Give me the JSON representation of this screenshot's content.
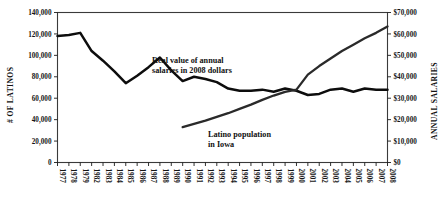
{
  "chart_data": {
    "type": "line",
    "title": "",
    "xlabel": "",
    "ylabel": "# OF LATINOS",
    "ylabel_right": "ANNUAL SALARIES",
    "grid": true,
    "legend_position": "inline-annotations",
    "ylim": [
      0,
      140000
    ],
    "ylim_right": [
      0,
      70000
    ],
    "ytick_labels": [
      "0",
      "20,000",
      "40,000",
      "60,000",
      "80,000",
      "100,000",
      "120,000",
      "140,000"
    ],
    "ytick_values": [
      0,
      20000,
      40000,
      60000,
      80000,
      100000,
      120000,
      140000
    ],
    "ytick_labels_right": [
      "$0",
      "$10,000",
      "$20,000",
      "$30,000",
      "$40,000",
      "$50,000",
      "$60,000",
      "$70,000"
    ],
    "ytick_values_right": [
      0,
      10000,
      20000,
      30000,
      40000,
      50000,
      60000,
      70000
    ],
    "categories": [
      "1977",
      "1978",
      "1979",
      "1982",
      "1983",
      "1984",
      "1985",
      "1986",
      "1987",
      "1988",
      "1989",
      "1990",
      "1991",
      "1992",
      "1993",
      "1994",
      "1995",
      "1996",
      "1997",
      "1998",
      "1999",
      "2000",
      "2001",
      "2002",
      "2003",
      "2004",
      "2005",
      "2006",
      "2007",
      "2008"
    ],
    "annotations": [
      {
        "text_line1": "Real value of annual",
        "text_line2": "salaries in 2008 dollars"
      },
      {
        "text_line1": "Latino population",
        "text_line2": "in Iowa"
      }
    ],
    "series": [
      {
        "name": "Real value of annual salaries in 2008 dollars",
        "axis": "right",
        "x": [
          "1977",
          "1978",
          "1979",
          "1982",
          "1983",
          "1984",
          "1985",
          "1986",
          "1987",
          "1988",
          "1989",
          "1990",
          "1991",
          "1992",
          "1993",
          "1994",
          "1995",
          "1996",
          "1997",
          "1998",
          "1999",
          "2000",
          "2001",
          "2002",
          "2003",
          "2004",
          "2005",
          "2006",
          "2007",
          "2008"
        ],
        "values": [
          59000,
          59500,
          60500,
          52000,
          47500,
          42500,
          37000,
          40500,
          44500,
          49000,
          43000,
          38000,
          40000,
          39000,
          37500,
          34500,
          33500,
          33500,
          34000,
          33000,
          34500,
          33500,
          31500,
          32000,
          34000,
          34500,
          33000,
          34500,
          34000,
          34000
        ]
      },
      {
        "name": "Latino population in Iowa",
        "axis": "left",
        "x": [
          "1990",
          "1991",
          "1992",
          "1993",
          "1994",
          "1995",
          "1996",
          "1997",
          "1998",
          "1999",
          "2000",
          "2001",
          "2002",
          "2003",
          "2004",
          "2005",
          "2006",
          "2007",
          "2008"
        ],
        "values": [
          33000,
          36000,
          39000,
          42500,
          46000,
          50000,
          54000,
          58500,
          62500,
          66000,
          68000,
          82000,
          90000,
          97000,
          104000,
          110000,
          116000,
          121000,
          127000
        ]
      }
    ]
  }
}
